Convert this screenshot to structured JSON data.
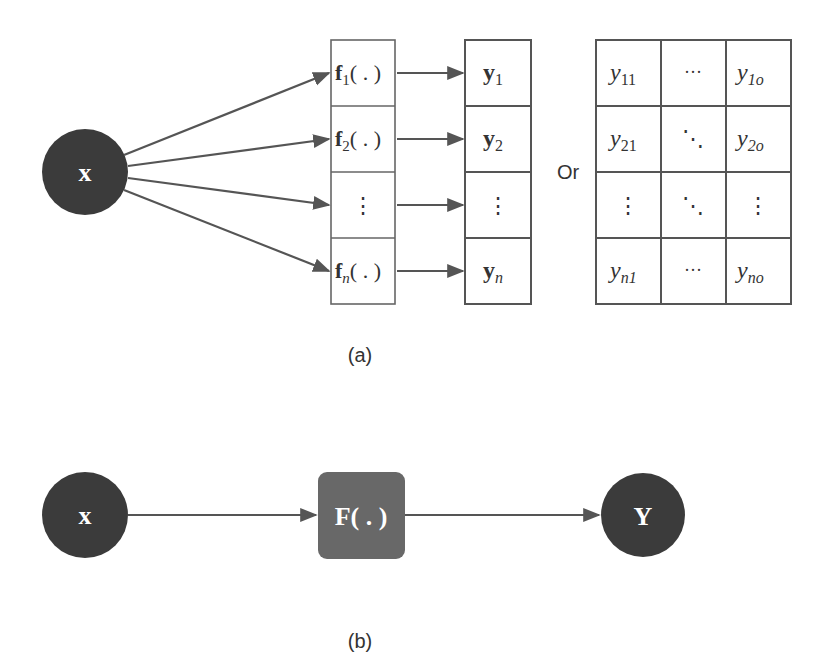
{
  "diagram_a": {
    "caption": "(a)",
    "input_node": "x",
    "functions": [
      {
        "main": "f",
        "sub": "1",
        "tail": "( . )"
      },
      {
        "main": "f",
        "sub": "2",
        "tail": "( . )"
      },
      {
        "main": "⋮",
        "sub": "",
        "tail": ""
      },
      {
        "main": "f",
        "sub": "n",
        "tail": "( . )"
      }
    ],
    "outputs": [
      {
        "main": "y",
        "sub": "1"
      },
      {
        "main": "y",
        "sub": "2"
      },
      {
        "main": "⋮",
        "sub": ""
      },
      {
        "main": "y",
        "sub": "n"
      }
    ],
    "or_label": "Or",
    "matrix": [
      [
        {
          "main": "y",
          "sub": "11"
        },
        {
          "main": "···",
          "sub": ""
        },
        {
          "main": "y",
          "sub": "1o"
        }
      ],
      [
        {
          "main": "y",
          "sub": "21"
        },
        {
          "main": "⋱",
          "sub": ""
        },
        {
          "main": "y",
          "sub": "2o"
        }
      ],
      [
        {
          "main": "⋮",
          "sub": ""
        },
        {
          "main": "⋱",
          "sub": ""
        },
        {
          "main": "⋮",
          "sub": ""
        }
      ],
      [
        {
          "main": "y",
          "sub": "n1"
        },
        {
          "main": "···",
          "sub": ""
        },
        {
          "main": "y",
          "sub": "no"
        }
      ]
    ]
  },
  "diagram_b": {
    "caption": "(b)",
    "input_node": "x",
    "function_node": "F( . )",
    "output_node": "Y"
  },
  "colors": {
    "node_dark": "#3b3b3b",
    "function_box": "#686868",
    "stroke": "#555555",
    "text": "#333333"
  }
}
